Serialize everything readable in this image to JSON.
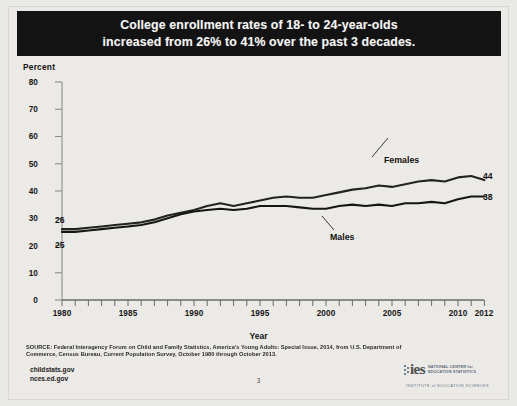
{
  "title": {
    "line1": "College enrollment rates of 18- to 24-year-olds",
    "line2": "increased from 26% to 41% over the past 3 decades."
  },
  "axis": {
    "y_title": "Percent",
    "x_title": "Year",
    "y_ticks": [
      "80",
      "70",
      "60",
      "50",
      "40",
      "30",
      "20",
      "10",
      "0"
    ],
    "x_ticks": [
      "1980",
      "1985",
      "1990",
      "1995",
      "2000",
      "2005",
      "2010",
      "2012"
    ]
  },
  "annotations": {
    "females_label": "Females",
    "males_label": "Males",
    "females_end_value": "44",
    "males_end_value": "38",
    "females_start_value": "26",
    "males_start_value": "25"
  },
  "footer": {
    "source": "SOURCE: Federal Interagency Forum on Child and Family Statistics, America's Young Adults: Special Issue, 2014, from U.S. Department of Commerce, Census Bureau, Current Population Survey, October 1980 through October 2013.",
    "link1": "childstats.gov",
    "link2": "nces.ed.gov",
    "page_number": "3"
  },
  "logo": {
    "wordmark": "ies",
    "org_line1": "NATIONAL CENTER for",
    "org_line2": "EDUCATION STATISTICS",
    "institute": "INSTITUTE of EDUCATION SCIENCES"
  },
  "colors": {
    "banner_bg": "#131313",
    "banner_text": "#f4f4f4",
    "plot_bg": "#eceae6",
    "line": "#1a1a1a"
  },
  "chart_data": {
    "type": "line",
    "title": "College enrollment rates of 18- to 24-year-olds increased from 26% to 41% over the past 3 decades.",
    "xlabel": "Year",
    "ylabel": "Percent",
    "xlim": [
      1980,
      2012
    ],
    "ylim": [
      0,
      80
    ],
    "ytick_step": 10,
    "grid": false,
    "legend": "inline-annotations",
    "x": [
      1980,
      1981,
      1982,
      1983,
      1984,
      1985,
      1986,
      1987,
      1988,
      1989,
      1990,
      1991,
      1992,
      1993,
      1994,
      1995,
      1996,
      1997,
      1998,
      1999,
      2000,
      2001,
      2002,
      2003,
      2004,
      2005,
      2006,
      2007,
      2008,
      2009,
      2010,
      2011,
      2012
    ],
    "series": [
      {
        "name": "Females",
        "end_label": "44",
        "start_label": "26",
        "values": [
          26,
          26,
          26.5,
          27,
          27.5,
          28,
          28.5,
          29.5,
          31,
          32,
          33,
          34.5,
          35.5,
          34.5,
          35.5,
          36.5,
          37.5,
          38,
          37.5,
          37.5,
          38.5,
          39.5,
          40.5,
          41,
          42,
          41.5,
          42.5,
          43.5,
          44,
          43.5,
          45,
          45.5,
          44
        ]
      },
      {
        "name": "Males",
        "end_label": "38",
        "start_label": "25",
        "values": [
          25,
          25,
          25.5,
          26,
          26.5,
          27,
          27.5,
          28.5,
          30,
          31.5,
          32.5,
          33,
          33.5,
          33,
          33.5,
          34.5,
          34.5,
          34.5,
          34,
          33.5,
          33.5,
          34.5,
          35,
          34.5,
          35,
          34.5,
          35.5,
          35.5,
          36,
          35.5,
          37,
          38,
          38
        ]
      }
    ]
  }
}
